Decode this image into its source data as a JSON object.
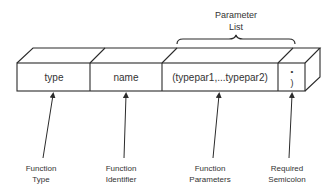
{
  "diagram": {
    "header": {
      "line1": "Parameter",
      "line2": "List"
    },
    "segments": [
      {
        "text": "type"
      },
      {
        "text": "name"
      },
      {
        "text": "(typepar1,...typepar2)"
      },
      {
        "dot": "•",
        "text": ")"
      }
    ],
    "labels": [
      {
        "line1": "Function",
        "line2": "Type"
      },
      {
        "line1": "Function",
        "line2": "Identifier"
      },
      {
        "line1": "Function",
        "line2": "Parameters"
      },
      {
        "line1": "Required",
        "line2": "Semicolon"
      }
    ],
    "colors": {
      "line": "#2b2b2b",
      "text": "#333333",
      "background": "#ffffff"
    }
  }
}
